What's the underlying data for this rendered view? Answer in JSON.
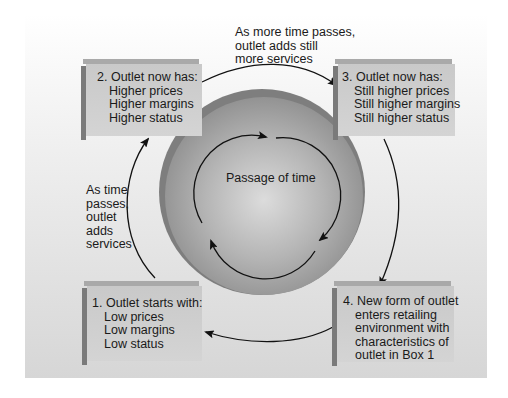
{
  "diagram": {
    "center_label": "Passage of time",
    "boxes": [
      {
        "number": "1.",
        "lines": [
          "Outlet starts with:",
          "Low prices",
          "Low margins",
          "Low status"
        ]
      },
      {
        "number": "2.",
        "lines": [
          "Outlet now has:",
          "Higher prices",
          "Higher margins",
          "Higher status"
        ]
      },
      {
        "number": "3.",
        "lines": [
          "Outlet now has:",
          "Still higher prices",
          "Still higher margins",
          "Still higher status"
        ]
      },
      {
        "number": "4.",
        "lines": [
          "New form of outlet",
          "enters retailing",
          "environment with",
          "characteristics of",
          "outlet in Box 1"
        ]
      }
    ],
    "transitions": {
      "left": [
        "As time",
        "passes,",
        "outlet",
        "adds",
        "services"
      ],
      "top": [
        "As more time passes,",
        "outlet adds still",
        "more services"
      ]
    },
    "colors": {
      "sphere_dark": "#8a8a8a",
      "sphere_light": "#d8d8d8",
      "box_fill": "#cfcfcf",
      "box_side": "#7a7a7a",
      "arrow": "#111111"
    }
  }
}
